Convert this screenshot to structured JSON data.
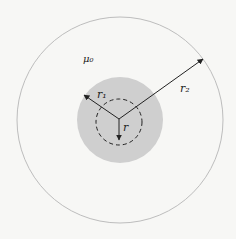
{
  "diagram": {
    "type": "coaxial-cross-section",
    "labels": {
      "medium": "μ₀",
      "r1": "r₁",
      "r2": "r₂",
      "r": "r"
    },
    "colors": {
      "background": "#f7f7f5",
      "outer_circle": "#bdbdbd",
      "inner_conductor": "#cfcfcf",
      "lines": "#222222"
    }
  }
}
